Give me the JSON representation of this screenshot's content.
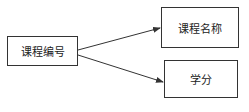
{
  "diagram": {
    "type": "functional-dependency",
    "nodes": [
      {
        "id": "course_id",
        "label": "课程编号"
      },
      {
        "id": "course_name",
        "label": "课程名称"
      },
      {
        "id": "credit",
        "label": "学分"
      }
    ],
    "edges": [
      {
        "from": "course_id",
        "to": "course_name"
      },
      {
        "from": "course_id",
        "to": "credit"
      }
    ],
    "caption": ""
  },
  "colors": {
    "line": "#333333",
    "background": "#ffffff"
  }
}
